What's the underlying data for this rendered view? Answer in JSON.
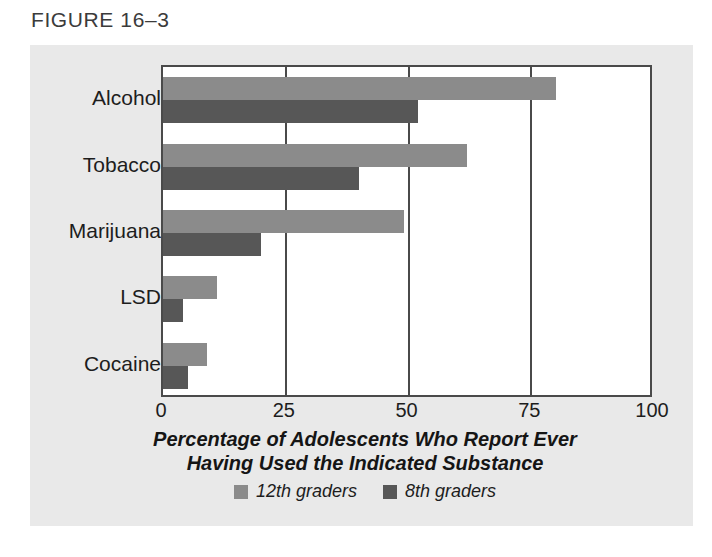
{
  "figure": {
    "label": "FIGURE 16–3"
  },
  "colors": {
    "panel_background": "#e9e9e9",
    "plot_background": "#ffffff",
    "frame": "#4a4a4a",
    "series_12th": "#8b8b8b",
    "series_8th": "#575757",
    "text": "#1d1d1d"
  },
  "chart_data": {
    "type": "bar",
    "orientation": "horizontal",
    "title": "",
    "xlabel": "Percentage of Adolescents Who Report Ever Having Used the Indicated Substance",
    "xlabel_lines": [
      "Percentage of Adolescents Who Report Ever",
      "Having Used the Indicated Substance"
    ],
    "ylabel": "",
    "categories": [
      "Alcohol",
      "Tobacco",
      "Marijuana",
      "LSD",
      "Cocaine"
    ],
    "series": [
      {
        "name": "12th graders",
        "color": "#8b8b8b",
        "values": [
          80,
          62,
          49,
          11,
          9
        ]
      },
      {
        "name": "8th graders",
        "color": "#575757",
        "values": [
          52,
          40,
          20,
          4,
          5
        ]
      }
    ],
    "xlim": [
      0,
      100
    ],
    "xticks": [
      0,
      25,
      50,
      75,
      100
    ],
    "xtick_labels": [
      "0",
      "25",
      "50",
      "75",
      "100"
    ],
    "gridlines": [
      25,
      50,
      75
    ],
    "grid": true,
    "legend_position": "bottom",
    "legend": [
      {
        "label": "12th graders",
        "color": "#8b8b8b"
      },
      {
        "label": "8th graders",
        "color": "#575757"
      }
    ]
  }
}
